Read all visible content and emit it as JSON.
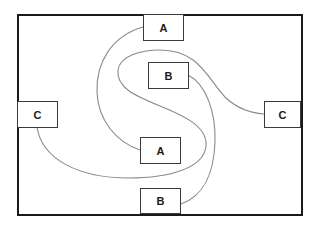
{
  "diagram": {
    "frame": {
      "border_color": "#1a1a1a",
      "background": "#ffffff"
    },
    "nodes": [
      {
        "id": "a-top",
        "label": "A"
      },
      {
        "id": "b-upper",
        "label": "B"
      },
      {
        "id": "c-left",
        "label": "C"
      },
      {
        "id": "c-right",
        "label": "C"
      },
      {
        "id": "a-lower",
        "label": "A"
      },
      {
        "id": "b-lower",
        "label": "B"
      }
    ],
    "connections": [
      {
        "from": "a-top",
        "to": "a-lower",
        "label": "A"
      },
      {
        "from": "b-upper",
        "to": "b-lower",
        "label": "B"
      },
      {
        "from": "c-left",
        "to": "c-right",
        "label": "C"
      }
    ],
    "line_color": "#8a8a8a",
    "node_border_color": "#3a3a3a"
  }
}
